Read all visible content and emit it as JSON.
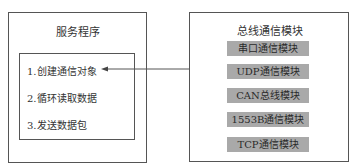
{
  "service": {
    "title": "服务程序",
    "steps": [
      {
        "label": "1.创建通信对象"
      },
      {
        "label": "2.循环读取数据"
      },
      {
        "label": "3.发送数据包"
      }
    ]
  },
  "bus": {
    "title": "总线通信模块",
    "modules": [
      {
        "label": "串口通信模块"
      },
      {
        "label": "UDP通信模块"
      },
      {
        "label": "CAN总线模块"
      },
      {
        "label": "1553B通信模块"
      },
      {
        "label": "TCP通信模块"
      }
    ]
  },
  "colors": {
    "module_fill": "#a9a9a9",
    "border": "#555555"
  }
}
